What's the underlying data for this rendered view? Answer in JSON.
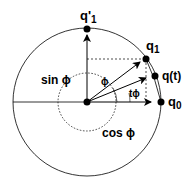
{
  "diagram": {
    "type": "slerp-unit-circle",
    "colors": {
      "stroke": "#000000",
      "background": "#ffffff"
    },
    "labels": {
      "q1_prime": "q'",
      "q1_prime_sub": "1",
      "q1": "q",
      "q1_sub": "1",
      "qt": "q(t)",
      "q0": "q",
      "q0_sub": "0",
      "sin_phi": "sin ϕ",
      "cos_phi": "cos ϕ",
      "phi": "ϕ",
      "t_phi": "tϕ"
    },
    "points": [
      {
        "name": "origin"
      },
      {
        "name": "q0"
      },
      {
        "name": "q1"
      },
      {
        "name": "q(t)"
      },
      {
        "name": "q'1"
      }
    ]
  }
}
